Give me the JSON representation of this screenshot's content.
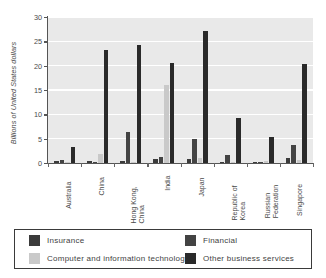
{
  "chart_data": {
    "type": "bar",
    "title": "",
    "xlabel": "",
    "ylabel": "Billions of United States dollars",
    "ylim": [
      0,
      30
    ],
    "yticks": [
      0,
      5,
      10,
      15,
      20,
      25,
      30
    ],
    "ytick_labels": [
      "0",
      "5",
      "10",
      "15",
      "20",
      "25",
      "30"
    ],
    "grid": "horizontal",
    "legend_position": "bottom",
    "categories": [
      "Australia",
      "China",
      "Hong Kong,\nChina",
      "India",
      "Japan",
      "Republic of\nKorea",
      "Russian\nFederation",
      "Singapore"
    ],
    "series": [
      {
        "name": "Insurance",
        "color": "#3b3b3b",
        "values": [
          0.4,
          0.4,
          0.4,
          0.8,
          0.8,
          0.3,
          0.2,
          1.1
        ]
      },
      {
        "name": "Financial",
        "color": "#434343",
        "values": [
          0.7,
          0.1,
          6.3,
          1.3,
          4.9,
          1.6,
          0.3,
          3.6
        ]
      },
      {
        "name": "Computer and information technology",
        "color": "#c9c9c9",
        "values": [
          0.3,
          1.8,
          0.1,
          16.0,
          1.1,
          0.1,
          0.4,
          0.6
        ]
      },
      {
        "name": "Other business services",
        "color": "#2a2a2a",
        "values": [
          3.3,
          23.2,
          24.3,
          20.5,
          27.2,
          9.3,
          5.3,
          20.3
        ]
      }
    ]
  },
  "legend": {
    "entries": [
      {
        "label": "Insurance",
        "color": "#3b3b3b"
      },
      {
        "label": "Financial",
        "color": "#434343"
      },
      {
        "label": "Computer and information technology",
        "color": "#c9c9c9"
      },
      {
        "label": "Other business services",
        "color": "#2a2a2a"
      }
    ]
  },
  "colors": {
    "plot_background": "#e9e9e9",
    "gridline": "#ffffff",
    "axis": "#555555",
    "text": "#4a4a4a",
    "legend_border": "#3a3a3a",
    "page_background": "#ffffff"
  }
}
